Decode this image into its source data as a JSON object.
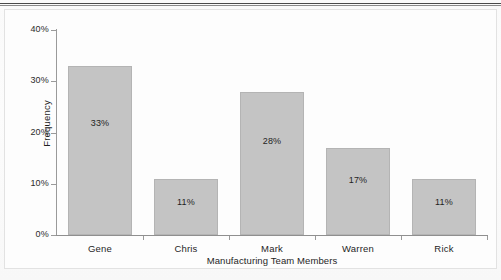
{
  "figure": {
    "background_color": "#fbfbfb",
    "frame_color": "#e2e2e2",
    "top_rule_color": "#4a4a4a"
  },
  "chart_data": {
    "type": "bar",
    "title": "",
    "categories": [
      "Gene",
      "Chris",
      "Mark",
      "Warren",
      "Rick"
    ],
    "values": [
      33,
      11,
      28,
      17,
      11
    ],
    "data_labels": [
      "33%",
      "11%",
      "28%",
      "17%",
      "11%"
    ],
    "xlabel": "Manufacturing Team Members",
    "ylabel": "Frequency",
    "ylim": [
      0,
      40
    ],
    "ytick_values": [
      0,
      10,
      20,
      30,
      40
    ],
    "ytick_labels": [
      "0%",
      "10%",
      "20%",
      "30%",
      "40%"
    ],
    "grid": false,
    "legend": false,
    "bar_color": "#c4c4c4",
    "bar_edge_color": "#b4b4b4",
    "axis_color": "#9a9a9a",
    "text_color": "#1f1f1f"
  }
}
